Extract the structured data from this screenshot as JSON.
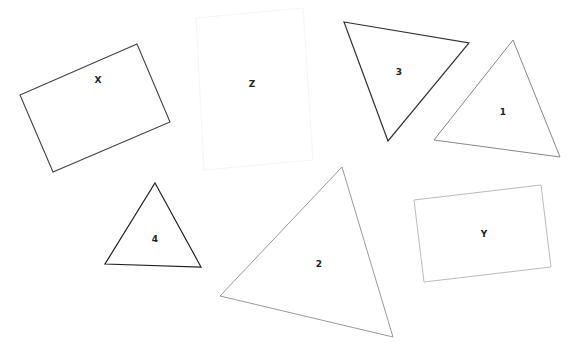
{
  "canvas": {
    "width": 578,
    "height": 359,
    "background": "#ffffff"
  },
  "shapes": [
    {
      "id": "X",
      "type": "rectangle",
      "label": "X",
      "stroke": "#444444",
      "stroke_width": 1.1,
      "points": "20,95 137,44 170,122 53,172",
      "label_pos": [
        98,
        80
      ]
    },
    {
      "id": "Z",
      "type": "rectangle",
      "label": "Z",
      "stroke": "#f4f4f4",
      "stroke_width": 1,
      "points": "196,18 303,8 313,160 204,170",
      "label_pos": [
        252,
        84
      ]
    },
    {
      "id": "3",
      "type": "triangle",
      "label": "3",
      "stroke": "#333333",
      "stroke_width": 1.2,
      "points": "344,22 469,43 388,141",
      "label_pos": [
        399,
        72
      ]
    },
    {
      "id": "1",
      "type": "triangle",
      "label": "1",
      "stroke": "#888888",
      "stroke_width": 1,
      "points": "513,40 560,157 434,140",
      "label_pos": [
        503,
        112
      ]
    },
    {
      "id": "4",
      "type": "triangle",
      "label": "4",
      "stroke": "#222222",
      "stroke_width": 1.2,
      "points": "155,183 201,267 105,264",
      "label_pos": [
        155,
        239
      ]
    },
    {
      "id": "2",
      "type": "triangle",
      "label": "2",
      "stroke": "#999999",
      "stroke_width": 1,
      "points": "342,167 393,337 220,296",
      "label_pos": [
        319,
        264
      ]
    },
    {
      "id": "Y",
      "type": "rectangle",
      "label": "Y",
      "stroke": "#bbbbbb",
      "stroke_width": 1,
      "points": "414,200 541,185 551,267 424,282",
      "label_pos": [
        484,
        234
      ]
    }
  ]
}
